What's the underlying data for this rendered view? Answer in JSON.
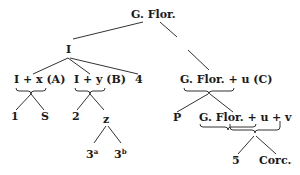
{
  "stemma": {
    "root": "G. Flor.",
    "I": "I",
    "IA": "I + x (A)",
    "IB": "I + y (B)",
    "n4": "4",
    "C": "G. Flor. + u (C)",
    "n1": "1",
    "S": "S",
    "n2": "2",
    "z": "z",
    "n3a": "3",
    "n3a_sup": "a",
    "n3b": "3",
    "n3b_sup": "b",
    "P": "P",
    "GFu": "G. Flor. + u",
    "pv": "+ v",
    "n5": "5",
    "Corc": "Corc."
  }
}
